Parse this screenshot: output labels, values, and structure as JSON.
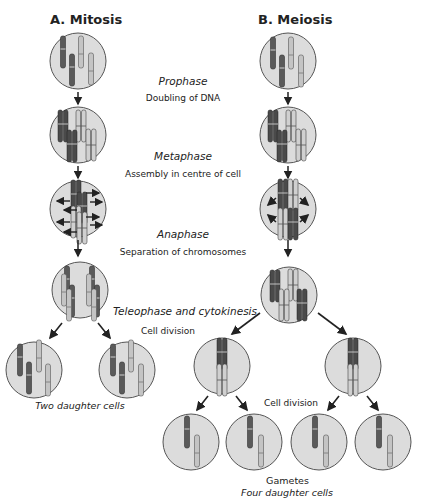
{
  "titles": {
    "mitosis": "A. Mitosis",
    "meiosis": "B. Meiosis"
  },
  "phases": [
    {
      "name": "Prophase",
      "description": "Doubling of DNA"
    },
    {
      "name": "Metaphase",
      "description": "Assembly in centre of cell"
    },
    {
      "name": "Anaphase",
      "description": "Separation of chromosomes"
    },
    {
      "name": "Teleophase and cytokinesis",
      "description": "Cell division"
    }
  ],
  "labels": {
    "second_division": "Cell division",
    "mitosis_result": "Two daughter cells",
    "meiosis_result_title": "Gametes",
    "meiosis_result": "Four daughter cells"
  },
  "colors": {
    "cell_fill": "#dcdcdc",
    "cell_stroke": "#555555",
    "chromosome_dark": "#5a5a5a",
    "chromosome_light": "#bdbdbd",
    "arrow": "#222222"
  }
}
